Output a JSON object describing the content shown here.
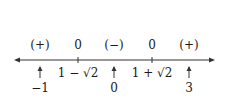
{
  "number_line": {
    "sign_labels": [
      {
        "text": "(+)",
        "x": 40
      },
      {
        "text": "0",
        "x": 78
      },
      {
        "text": "(−)",
        "x": 114
      },
      {
        "text": "0",
        "x": 152
      },
      {
        "text": "(+)",
        "x": 189
      }
    ],
    "critical_points": [
      {
        "text": "1 − √2",
        "x": 78
      },
      {
        "text": "1 + √2",
        "x": 152
      }
    ],
    "test_points": [
      {
        "text": "−1",
        "x": 40
      },
      {
        "text": "0",
        "x": 114
      },
      {
        "text": "3",
        "x": 189
      }
    ]
  }
}
